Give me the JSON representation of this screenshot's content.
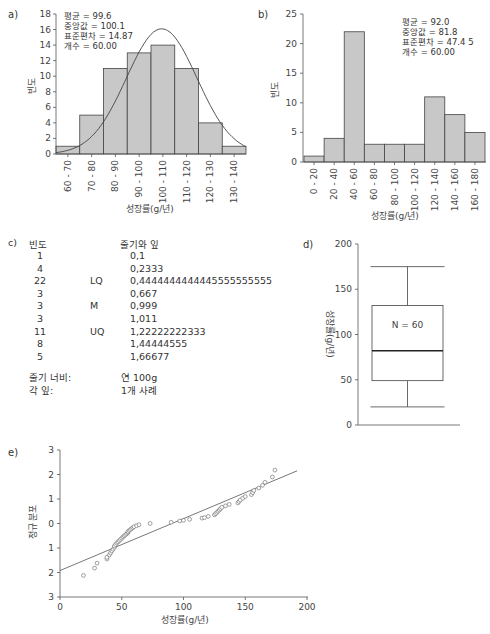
{
  "chart_data": [
    {
      "panel": "a)",
      "type": "bar",
      "subtype": "histogram",
      "categories": [
        "60 - 70",
        "70 - 80",
        "80 - 90",
        "90 - 100",
        "100 - 110",
        "110 - 120",
        "120 - 130",
        "130 - 140"
      ],
      "values": [
        1,
        5,
        11,
        13,
        14,
        11,
        4,
        1
      ],
      "overlay": "normal-curve",
      "stats": [
        "평균 = 99.6",
        "중앙값 = 100.1",
        "표준편차 = 14.87",
        "개수 = 60.00"
      ],
      "curve": {
        "mean": 99.6,
        "sd": 14.87,
        "n": 60,
        "bin_width": 10
      },
      "xlabel": "성장률(g/년)",
      "ylabel": "빈도",
      "ylim": [
        0,
        18
      ],
      "yticks": [
        0,
        2,
        4,
        6,
        8,
        10,
        12,
        14,
        16,
        18
      ]
    },
    {
      "panel": "b)",
      "type": "bar",
      "subtype": "histogram",
      "categories": [
        "0 - 20",
        "20 - 40",
        "40 - 60",
        "60 - 80",
        "80 - 100",
        "100 - 120",
        "120 - 140",
        "140 - 160",
        "160 - 180"
      ],
      "values": [
        1,
        4,
        22,
        3,
        3,
        3,
        11,
        8,
        5
      ],
      "stats": [
        "평균 = 92.0",
        "중앙값 = 81.8",
        "표준편차 = 47.4  5",
        "개수 = 60.00"
      ],
      "xlabel": "성장률(g/년)",
      "ylabel": "빈도",
      "ylim": [
        0,
        25
      ],
      "yticks": [
        0,
        5,
        10,
        15,
        20,
        25
      ]
    },
    {
      "panel": "c)",
      "type": "table",
      "subtype": "stem-and-leaf",
      "headers": {
        "freq": "빈도",
        "stemleaf": "줄기와 잎"
      },
      "rows": [
        {
          "freq": "1",
          "marker": "",
          "stemleaf": "0,1"
        },
        {
          "freq": "4",
          "marker": "",
          "stemleaf": "0,2333"
        },
        {
          "freq": "22",
          "marker": "LQ",
          "stemleaf": "0,4444444444445555555555"
        },
        {
          "freq": "3",
          "marker": "",
          "stemleaf": "0,667"
        },
        {
          "freq": "3",
          "marker": "M",
          "stemleaf": "0,999"
        },
        {
          "freq": "3",
          "marker": "",
          "stemleaf": "1,011"
        },
        {
          "freq": "11",
          "marker": "UQ",
          "stemleaf": "1,22222222333"
        },
        {
          "freq": "8",
          "marker": "",
          "stemleaf": "1,44444555"
        },
        {
          "freq": "5",
          "marker": "",
          "stemleaf": "1,66677"
        }
      ],
      "footer": [
        {
          "label": "줄기 너비:",
          "value": "연 100g"
        },
        {
          "label": "각 잎:",
          "value": "1개 사례"
        }
      ]
    },
    {
      "panel": "d)",
      "type": "boxplot",
      "whisker_low": 20,
      "q1": 49,
      "median": 82,
      "q3": 132,
      "whisker_high": 175,
      "annotation": "N = 60",
      "ylabel": "성장률(g/년)",
      "ylim": [
        0,
        200
      ],
      "yticks": [
        0,
        50,
        100,
        150,
        200
      ]
    },
    {
      "panel": "e)",
      "type": "scatter",
      "subtype": "normal-probability-plot",
      "xlabel": "성장률(g/년)",
      "ylabel": "정규 분포",
      "xlim": [
        0,
        200
      ],
      "ylim": [
        -3,
        3
      ],
      "xticks": [
        0,
        50,
        100,
        150,
        200
      ],
      "yticks": [
        3,
        2,
        1,
        0,
        -1,
        -2,
        -3
      ],
      "ytick_labels": [
        "3",
        "2",
        "1",
        "0",
        "1",
        "2",
        "3"
      ],
      "line": {
        "x": [
          0,
          192
        ],
        "y": [
          -1.92,
          2.15
        ]
      },
      "points": [
        {
          "x": 19,
          "y": -2.12
        },
        {
          "x": 28,
          "y": -1.82
        },
        {
          "x": 30,
          "y": -1.62
        },
        {
          "x": 38,
          "y": -1.45
        },
        {
          "x": 38,
          "y": -1.38
        },
        {
          "x": 40,
          "y": -1.28
        },
        {
          "x": 41,
          "y": -1.2
        },
        {
          "x": 42,
          "y": -1.12
        },
        {
          "x": 43,
          "y": -1.05
        },
        {
          "x": 44,
          "y": -0.98
        },
        {
          "x": 44,
          "y": -0.92
        },
        {
          "x": 45,
          "y": -0.86
        },
        {
          "x": 46,
          "y": -0.8
        },
        {
          "x": 47,
          "y": -0.75
        },
        {
          "x": 48,
          "y": -0.7
        },
        {
          "x": 49,
          "y": -0.65
        },
        {
          "x": 50,
          "y": -0.6
        },
        {
          "x": 51,
          "y": -0.55
        },
        {
          "x": 52,
          "y": -0.5
        },
        {
          "x": 53,
          "y": -0.46
        },
        {
          "x": 54,
          "y": -0.42
        },
        {
          "x": 55,
          "y": -0.38
        },
        {
          "x": 55,
          "y": -0.33
        },
        {
          "x": 56,
          "y": -0.29
        },
        {
          "x": 57,
          "y": -0.25
        },
        {
          "x": 58,
          "y": -0.21
        },
        {
          "x": 59,
          "y": -0.17
        },
        {
          "x": 60,
          "y": -0.13
        },
        {
          "x": 62,
          "y": -0.09
        },
        {
          "x": 64,
          "y": -0.05
        },
        {
          "x": 73,
          "y": 0.0
        },
        {
          "x": 90,
          "y": 0.05
        },
        {
          "x": 97,
          "y": 0.1
        },
        {
          "x": 100,
          "y": 0.13
        },
        {
          "x": 105,
          "y": 0.17
        },
        {
          "x": 115,
          "y": 0.22
        },
        {
          "x": 117,
          "y": 0.24
        },
        {
          "x": 120,
          "y": 0.29
        },
        {
          "x": 125,
          "y": 0.35
        },
        {
          "x": 126,
          "y": 0.4
        },
        {
          "x": 127,
          "y": 0.45
        },
        {
          "x": 128,
          "y": 0.5
        },
        {
          "x": 129,
          "y": 0.55
        },
        {
          "x": 130,
          "y": 0.6
        },
        {
          "x": 131,
          "y": 0.66
        },
        {
          "x": 134,
          "y": 0.72
        },
        {
          "x": 137,
          "y": 0.78
        },
        {
          "x": 144,
          "y": 0.84
        },
        {
          "x": 145,
          "y": 0.9
        },
        {
          "x": 146,
          "y": 0.96
        },
        {
          "x": 148,
          "y": 1.03
        },
        {
          "x": 150,
          "y": 1.1
        },
        {
          "x": 155,
          "y": 1.18
        },
        {
          "x": 156,
          "y": 1.26
        },
        {
          "x": 157,
          "y": 1.35
        },
        {
          "x": 161,
          "y": 1.45
        },
        {
          "x": 164,
          "y": 1.56
        },
        {
          "x": 166,
          "y": 1.68
        },
        {
          "x": 172,
          "y": 1.9
        },
        {
          "x": 174,
          "y": 2.18
        }
      ]
    }
  ]
}
